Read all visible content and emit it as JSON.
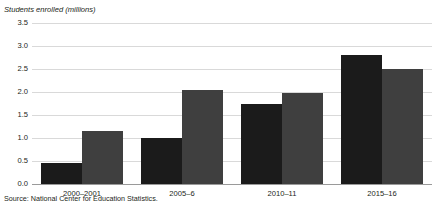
{
  "figure": {
    "y_axis_title": "Students enrolled (millions)",
    "source_note": "Source: National Center for Education Statistics.",
    "cutoff_title": ""
  },
  "chart_data": {
    "type": "bar",
    "title": "",
    "xlabel": "",
    "ylabel": "Students enrolled (millions)",
    "categories": [
      "2000–2001",
      "2005–6",
      "2010–11",
      "2015–16"
    ],
    "series": [
      {
        "name": "series-1",
        "color": "#1b1b1b",
        "values": [
          0.45,
          1.0,
          1.75,
          2.8
        ]
      },
      {
        "name": "series-2",
        "color": "#3f3f3f",
        "values": [
          1.15,
          2.05,
          1.97,
          2.5
        ]
      }
    ],
    "ylim": [
      0.0,
      3.5
    ],
    "ytick_values": [
      0.0,
      0.5,
      1.0,
      1.5,
      2.0,
      2.5,
      3.0,
      3.5
    ],
    "ytick_labels": [
      "0.0",
      "0.5",
      "1.0",
      "1.5",
      "2.0",
      "2.5",
      "3.0",
      "3.5"
    ],
    "grid": true,
    "legend": "none",
    "source": "Source: National Center for Education Statistics."
  },
  "colors": {
    "series_1": "#1b1b1b",
    "series_2": "#3f3f3f",
    "gridline": "#d9d9d9",
    "baseline": "#9a9a9a",
    "text": "#231f20",
    "background": "#ffffff"
  }
}
